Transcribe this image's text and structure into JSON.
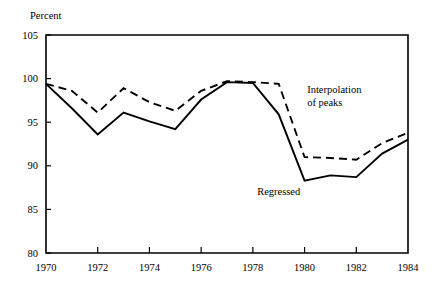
{
  "chart_data": {
    "type": "line",
    "title": "",
    "subtitle": "",
    "xlabel": "",
    "ylabel": "Percent",
    "ylabel_position": "top-left",
    "xlim": [
      1970,
      1984
    ],
    "ylim": [
      80,
      105
    ],
    "grid": false,
    "legend": "inline-annotations",
    "y_ticks": [
      80,
      85,
      90,
      95,
      100,
      105
    ],
    "y_tick_labels": [
      "80",
      "85",
      "90",
      "95",
      "100",
      "105"
    ],
    "x_ticks": [
      1970,
      1972,
      1974,
      1976,
      1978,
      1980,
      1982,
      1984
    ],
    "x_tick_labels": [
      "1970",
      "1972",
      "1974",
      "1976",
      "1978",
      "1980",
      "1982",
      "1984"
    ],
    "x_minor_ticks": [
      1971,
      1973,
      1975,
      1977,
      1979,
      1981,
      1983
    ],
    "x": [
      1970,
      1971,
      1972,
      1973,
      1974,
      1975,
      1976,
      1977,
      1978,
      1979,
      1980,
      1981,
      1982,
      1983,
      1984
    ],
    "series": [
      {
        "name": "Regressed",
        "style": "solid",
        "label": "Regressed",
        "label_x": 1979.0,
        "label_y": 86.6,
        "values": [
          99.4,
          96.6,
          93.6,
          96.1,
          95.1,
          94.2,
          97.6,
          99.6,
          99.5,
          95.9,
          88.3,
          88.9,
          88.7,
          91.4,
          93.0
        ]
      },
      {
        "name": "Interpolation of peaks",
        "style": "dashed",
        "label": "Interpolation\nof peaks",
        "label_line1": "Interpolation",
        "label_line2": "of peaks",
        "label_x": 1980.1,
        "label_y": 98.3,
        "values": [
          99.4,
          98.6,
          96.1,
          98.9,
          97.3,
          96.3,
          98.6,
          99.7,
          99.6,
          99.4,
          91.0,
          90.9,
          90.7,
          92.6,
          93.8
        ]
      }
    ]
  },
  "figure": {
    "plot_left_px": 46,
    "plot_right_px": 408,
    "plot_top_px": 35,
    "plot_bottom_px": 253
  }
}
